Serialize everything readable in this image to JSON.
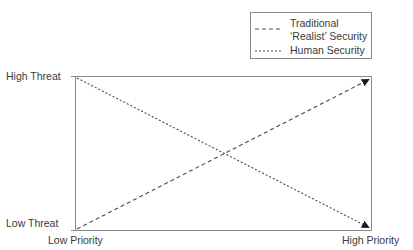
{
  "legend": {
    "items": [
      {
        "label_line1": "Traditional",
        "label_line2": "‘Realist’ Security",
        "line_style": "dashed",
        "dasharray": "4,3"
      },
      {
        "label_line1": "Human Security",
        "line_style": "dotted",
        "dasharray": "2,2"
      }
    ]
  },
  "axes": {
    "y_top_label": "High Threat",
    "y_bottom_label": "Low Threat",
    "x_left_label": "Low Priority",
    "x_right_label": "High Priority"
  },
  "lines": [
    {
      "name": "Traditional ‘Realist’ Security",
      "from": "Low Threat / Low Priority",
      "to": "High Threat / High Priority",
      "direction": "rising",
      "dasharray": "4,3"
    },
    {
      "name": "Human Security",
      "from": "High Threat / Low Priority",
      "to": "Low Threat / High Priority",
      "direction": "falling",
      "dasharray": "2,2"
    }
  ],
  "colors": {
    "frame": "#8a8a8a",
    "line": "#4a4a4a",
    "arrowhead": "#1a1a1a",
    "text": "#3a3a3a"
  }
}
